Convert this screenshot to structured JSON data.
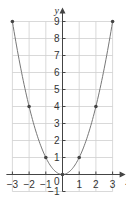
{
  "chart_data": {
    "type": "line",
    "title": "",
    "xlabel": "x",
    "ylabel": "y",
    "x": [
      -3,
      -2,
      -1,
      0,
      1,
      2,
      3
    ],
    "series": [
      {
        "name": "y = x^2",
        "values": [
          9,
          4,
          1,
          0,
          1,
          4,
          9
        ],
        "markers": true
      }
    ],
    "xlim": [
      -3,
      3
    ],
    "ylim": [
      -1,
      9
    ],
    "xticks": [
      "-3",
      "-2",
      "-1",
      "0",
      "1",
      "2",
      "3"
    ],
    "yticks": [
      "-1",
      "1",
      "2",
      "3",
      "4",
      "5",
      "6",
      "7",
      "8",
      "9"
    ],
    "origin_label": "0",
    "grid": true,
    "colors": {
      "line": "#777777",
      "marker": "#444444",
      "grid": "#cfcfcf",
      "axis": "#444444"
    }
  }
}
